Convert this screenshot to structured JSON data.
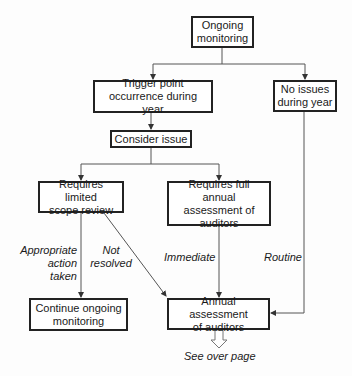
{
  "nodes": {
    "ongoing": "Ongoing\nmonitoring",
    "trigger": "Trigger point\noccurrence during year",
    "no_issues": "No issues\nduring year",
    "consider": "Consider issue",
    "limited": "Requires limited\nscope review",
    "full": "Requires full annual\nassessment of\nauditors",
    "continue": "Continue ongoing\nmonitoring",
    "annual": "Annual assessment\nof auditors"
  },
  "edge_labels": {
    "appropriate": "Appropriate\naction taken",
    "not_resolved": "Not\nresolved",
    "immediate": "Immediate",
    "routine": "Routine",
    "see_over": "See over page"
  },
  "colors": {
    "line": "#444444",
    "border": "#222222"
  }
}
